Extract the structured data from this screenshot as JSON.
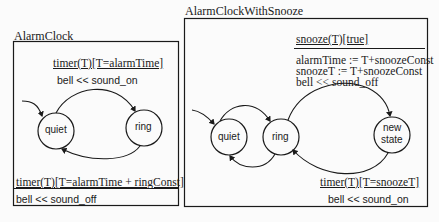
{
  "diagrams": [
    {
      "title": "AlarmClock",
      "states": [
        {
          "id": "quiet",
          "label": "quiet"
        },
        {
          "id": "ring",
          "label": "ring"
        }
      ],
      "transitions": [
        {
          "from": "quiet",
          "to": "ring",
          "event_guard": "timer(T)[T=alarmTime]",
          "action": "bell << sound_on"
        },
        {
          "from": "ring",
          "to": "quiet",
          "event_guard": "timer(T)[T=alarmTime + ringConst]",
          "action": "bell << sound_off"
        }
      ]
    },
    {
      "title": "AlarmClockWithSnooze",
      "states": [
        {
          "id": "quiet",
          "label": "quiet"
        },
        {
          "id": "ring",
          "label": "ring"
        },
        {
          "id": "new_state",
          "label_line1": "new",
          "label_line2": "state"
        }
      ],
      "transitions": [
        {
          "from": "ring",
          "to": "new_state",
          "event_guard": "snooze(T)[true]",
          "actions": [
            "alarmTime := T+snoozeConst",
            "snoozeT := T+snoozeConst",
            "bell << sound_off"
          ]
        },
        {
          "from": "new_state",
          "to": "ring",
          "event_guard": "timer(T)[T=snoozeT]",
          "action": "bell << sound_on"
        }
      ]
    }
  ],
  "colors": {
    "ink": "#1a1a1a",
    "background": "#fbfbfb"
  }
}
